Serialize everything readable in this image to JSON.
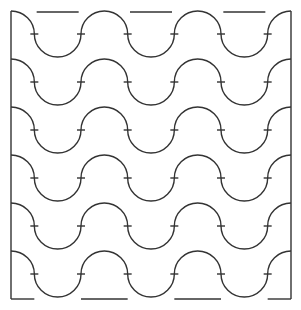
{
  "diagram": {
    "title": "",
    "type": "wave-tile-pattern",
    "rows": 6,
    "half_waves_per_row": 6,
    "tick_marks_per_row": 6,
    "stroke_color": "#333333",
    "background_color": "#ffffff"
  }
}
